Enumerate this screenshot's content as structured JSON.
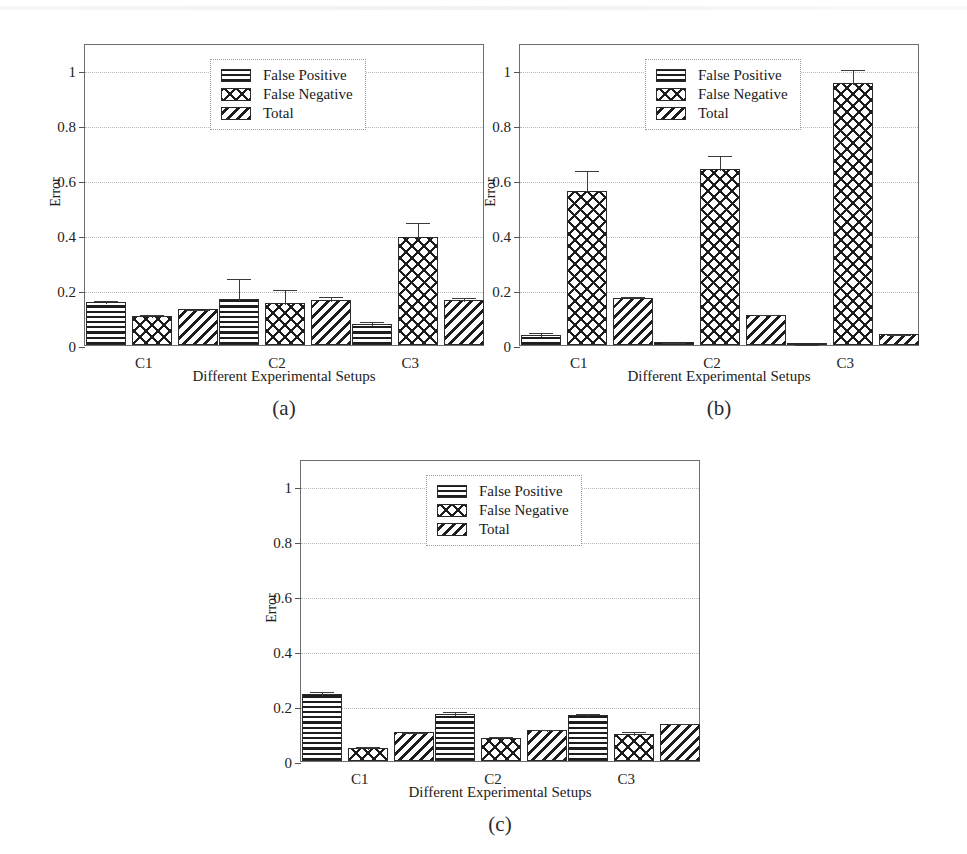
{
  "figure": {
    "background": "#ffffff",
    "series_colors": {
      "false_positive": "#1d1d1d",
      "false_negative": "#1d1d1d",
      "total": "#1d1d1d"
    },
    "grid_color": "#b9b9b9",
    "axis_color": "#6e6e6e"
  },
  "legend": {
    "items": [
      {
        "label": "False Positive",
        "pattern": "horizontal-lines"
      },
      {
        "label": "False Negative",
        "pattern": "cross-hatch"
      },
      {
        "label": "Total",
        "pattern": "diagonal-lines"
      }
    ]
  },
  "axes": {
    "ylabel": "Error",
    "xlabel": "Different Experimental Setups",
    "yticks": [
      "0",
      "0.2",
      "0.4",
      "0.6",
      "0.8",
      "1"
    ],
    "ytick_values": [
      0,
      0.2,
      0.4,
      0.6,
      0.8,
      1
    ],
    "ylim": [
      0,
      1.1
    ],
    "xticks": [
      "C1",
      "C2",
      "C3"
    ]
  },
  "captions": {
    "a": "(a)",
    "b": "(b)",
    "c": "(c)"
  },
  "chart_data": [
    {
      "panel": "(a)",
      "type": "bar",
      "title": "",
      "xlabel": "Different Experimental Setups",
      "ylabel": "Error",
      "ylim": [
        0,
        1.1
      ],
      "grid": true,
      "legend_position": "upper-center",
      "categories": [
        "C1",
        "C2",
        "C3"
      ],
      "series": [
        {
          "name": "False Positive",
          "values": [
            0.155,
            0.168,
            0.078
          ],
          "errors": [
            0.012,
            0.08,
            0.012
          ]
        },
        {
          "name": "False Negative",
          "values": [
            0.105,
            0.152,
            0.395
          ],
          "errors": [
            0.012,
            0.056,
            0.055
          ]
        },
        {
          "name": "Total",
          "values": [
            0.13,
            0.163,
            0.165
          ],
          "errors": [
            0.006,
            0.02,
            0.012
          ]
        }
      ]
    },
    {
      "panel": "(b)",
      "type": "bar",
      "title": "",
      "xlabel": "Different Experimental Setups",
      "ylabel": "Error",
      "ylim": [
        0,
        1.1
      ],
      "grid": true,
      "legend_position": "upper-center",
      "categories": [
        "C1",
        "C2",
        "C3"
      ],
      "series": [
        {
          "name": "False Positive",
          "values": [
            0.035,
            0.012,
            0.004
          ],
          "errors": [
            0.015,
            0.003,
            0.002
          ]
        },
        {
          "name": "False Negative",
          "values": [
            0.56,
            0.64,
            0.955
          ],
          "errors": [
            0.08,
            0.055,
            0.055
          ]
        },
        {
          "name": "Total",
          "values": [
            0.172,
            0.11,
            0.04
          ],
          "errors": [
            0.01,
            0.008,
            0.004
          ]
        }
      ]
    },
    {
      "panel": "(c)",
      "type": "bar",
      "title": "",
      "xlabel": "Different Experimental Setups",
      "ylabel": "Error",
      "ylim": [
        0,
        1.1
      ],
      "grid": true,
      "legend_position": "upper-center",
      "categories": [
        "C1",
        "C2",
        "C3"
      ],
      "series": [
        {
          "name": "False Positive",
          "values": [
            0.245,
            0.172,
            0.168
          ],
          "errors": [
            0.015,
            0.012,
            0.01
          ]
        },
        {
          "name": "False Negative",
          "values": [
            0.048,
            0.085,
            0.1
          ],
          "errors": [
            0.01,
            0.01,
            0.012
          ]
        },
        {
          "name": "Total",
          "values": [
            0.105,
            0.113,
            0.135
          ],
          "errors": [
            0.006,
            0.006,
            0.006
          ]
        }
      ]
    }
  ]
}
